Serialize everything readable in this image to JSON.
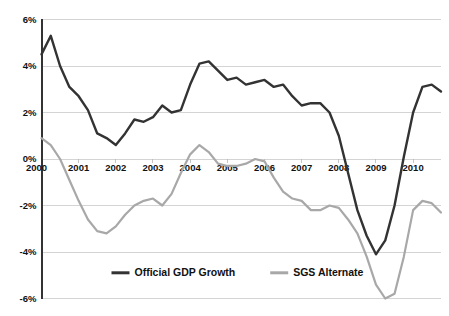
{
  "chart_data": {
    "type": "line",
    "title": "",
    "subtitle": "",
    "xlabel": "",
    "ylabel": "",
    "ylim": [
      -6,
      6
    ],
    "xlim": [
      2000,
      2010.75
    ],
    "grid": true,
    "legend_position": "bottom-center",
    "ytick_labels": [
      "6%",
      "4%",
      "2%",
      "0%",
      "-2%",
      "-4%",
      "-6%"
    ],
    "ytick_values": [
      6,
      4,
      2,
      0,
      -2,
      -4,
      -6
    ],
    "xtick_labels": [
      "2000",
      "2001",
      "2002",
      "2003",
      "2004",
      "2005",
      "2006",
      "2007",
      "2008",
      "2009",
      "2010"
    ],
    "xtick_values": [
      2000,
      2001,
      2002,
      2003,
      2004,
      2005,
      2006,
      2007,
      2008,
      2009,
      2010
    ],
    "series": [
      {
        "name": "Official GDP Growth",
        "color": "#333333",
        "x": [
          2000.0,
          2000.25,
          2000.5,
          2000.75,
          2001.0,
          2001.25,
          2001.5,
          2001.75,
          2002.0,
          2002.25,
          2002.5,
          2002.75,
          2003.0,
          2003.25,
          2003.5,
          2003.75,
          2004.0,
          2004.25,
          2004.5,
          2004.75,
          2005.0,
          2005.25,
          2005.5,
          2005.75,
          2006.0,
          2006.25,
          2006.5,
          2006.75,
          2007.0,
          2007.25,
          2007.5,
          2007.75,
          2008.0,
          2008.25,
          2008.5,
          2008.75,
          2009.0,
          2009.25,
          2009.5,
          2009.75,
          2010.0,
          2010.25,
          2010.5,
          2010.75
        ],
        "values": [
          4.5,
          5.3,
          4.0,
          3.1,
          2.7,
          2.1,
          1.1,
          0.9,
          0.6,
          1.1,
          1.7,
          1.6,
          1.8,
          2.3,
          2.0,
          2.1,
          3.2,
          4.1,
          4.2,
          3.8,
          3.4,
          3.5,
          3.2,
          3.3,
          3.4,
          3.1,
          3.2,
          2.7,
          2.3,
          2.4,
          2.4,
          2.0,
          1.0,
          -0.6,
          -2.2,
          -3.3,
          -4.1,
          -3.5,
          -2.0,
          0.1,
          2.0,
          3.1,
          3.2,
          2.9
        ]
      },
      {
        "name": "SGS Alternate",
        "color": "#a8a8a8",
        "x": [
          2000.0,
          2000.25,
          2000.5,
          2000.75,
          2001.0,
          2001.25,
          2001.5,
          2001.75,
          2002.0,
          2002.25,
          2002.5,
          2002.75,
          2003.0,
          2003.25,
          2003.5,
          2003.75,
          2004.0,
          2004.25,
          2004.5,
          2004.75,
          2005.0,
          2005.25,
          2005.5,
          2005.75,
          2006.0,
          2006.25,
          2006.5,
          2006.75,
          2007.0,
          2007.25,
          2007.5,
          2007.75,
          2008.0,
          2008.25,
          2008.5,
          2008.75,
          2009.0,
          2009.25,
          2009.5,
          2009.75,
          2010.0,
          2010.25,
          2010.5,
          2010.75
        ],
        "values": [
          0.9,
          0.6,
          0.0,
          -0.9,
          -1.8,
          -2.6,
          -3.1,
          -3.2,
          -2.9,
          -2.4,
          -2.0,
          -1.8,
          -1.7,
          -2.0,
          -1.5,
          -0.6,
          0.2,
          0.6,
          0.3,
          -0.2,
          -0.3,
          -0.3,
          -0.2,
          0.0,
          -0.1,
          -0.8,
          -1.4,
          -1.7,
          -1.8,
          -2.2,
          -2.2,
          -2.0,
          -2.1,
          -2.6,
          -3.2,
          -4.2,
          -5.4,
          -6.0,
          -5.8,
          -4.2,
          -2.2,
          -1.8,
          -1.9,
          -2.3
        ]
      }
    ],
    "legend": [
      {
        "label": "Official GDP Growth",
        "color": "#333333"
      },
      {
        "label": "SGS Alternate",
        "color": "#a8a8a8"
      }
    ]
  },
  "colors": {
    "background": "#ffffff",
    "grid": "#c9c9c9",
    "axis": "#333333",
    "official_series": "#333333",
    "sgs_series": "#a8a8a8",
    "text": "#111111"
  }
}
